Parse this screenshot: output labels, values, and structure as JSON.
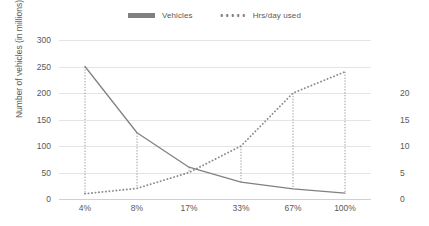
{
  "chart_data": {
    "type": "line",
    "title": "",
    "subtitle": "",
    "xlabel": "",
    "ylabel": "Number of vehicles (in millions)",
    "y2label": "",
    "categories": [
      "4%",
      "8%",
      "17%",
      "33%",
      "67%",
      "100%"
    ],
    "series": [
      {
        "name": "Vehicles",
        "axis": "left",
        "style": "solid",
        "color": "#808080",
        "values": [
          250,
          125,
          60,
          32,
          19,
          11
        ]
      },
      {
        "name": "Hrs/day used",
        "axis": "right",
        "style": "dotted",
        "color": "#8c8c8c",
        "values": [
          1,
          2,
          5,
          10,
          20,
          24
        ]
      }
    ],
    "ylim": [
      0,
      300
    ],
    "yticks": [
      0,
      50,
      100,
      150,
      200,
      250,
      300
    ],
    "ytick_labels": [
      "0",
      "50",
      "100",
      "150",
      "200",
      "250",
      "300"
    ],
    "y2lim": [
      0,
      30
    ],
    "y2ticks": [
      0,
      5,
      10,
      15,
      20,
      25,
      30
    ],
    "y2tick_labels": [
      "0",
      "5",
      "10",
      "15",
      "20",
      "",
      ""
    ],
    "grid": true,
    "grid_axis": "y",
    "legend_position": "top",
    "dropline_style": "dotted",
    "background_color": "#ffffff",
    "gridline_color": "#e4e4e4",
    "text_color": "#595959"
  },
  "legend": {
    "items": [
      {
        "label": "Vehicles",
        "marker": "solid-line-swatch"
      },
      {
        "label": "Hrs/day used",
        "marker": "dotted-line-swatch"
      }
    ]
  }
}
